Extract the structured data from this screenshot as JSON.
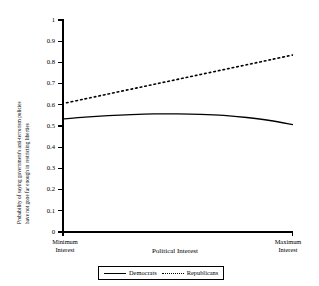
{
  "chart_data": {
    "type": "line",
    "title": "",
    "xlabel": "Political Interest",
    "ylabel_line1": "Probability of saying government's anti-terrorism policies",
    "ylabel_line2": "have not gone far enough in restricting liberties",
    "ylim": [
      0,
      1
    ],
    "yticks": [
      "0",
      "0.1",
      "0.2",
      "0.3",
      "0.4",
      "0.5",
      "0.6",
      "0.7",
      "0.8",
      "0.9",
      "1"
    ],
    "ytick_values": [
      0,
      0.1,
      0.2,
      0.3,
      0.4,
      0.5,
      0.6,
      0.7,
      0.8,
      0.9,
      1
    ],
    "xlim": [
      0,
      1
    ],
    "xtick_labels": [
      "Minimum Interest",
      "Maximum Interest"
    ],
    "xtick_label_left_line1": "Minimum",
    "xtick_label_left_line2": "Interest",
    "xtick_label_right_line1": "Maximum",
    "xtick_label_right_line2": "Interest",
    "grid": false,
    "legend_position": "bottom",
    "x": [
      0,
      0.1,
      0.2,
      0.3,
      0.4,
      0.5,
      0.6,
      0.7,
      0.8,
      0.9,
      1
    ],
    "series": [
      {
        "name": "Democrats",
        "style": "solid",
        "color": "#000000",
        "values": [
          0.533,
          0.542,
          0.549,
          0.554,
          0.557,
          0.557,
          0.555,
          0.55,
          0.54,
          0.526,
          0.506
        ]
      },
      {
        "name": "Republicans",
        "style": "dotted",
        "color": "#000000",
        "values": [
          0.605,
          0.628,
          0.651,
          0.674,
          0.697,
          0.72,
          0.743,
          0.766,
          0.789,
          0.812,
          0.835
        ]
      }
    ]
  },
  "legend": {
    "items": [
      {
        "label": "Democrats",
        "style": "solid"
      },
      {
        "label": "Republicans",
        "style": "dotted"
      }
    ]
  },
  "colors": {
    "axis": "#000000",
    "background": "#ffffff",
    "series": "#000000"
  }
}
